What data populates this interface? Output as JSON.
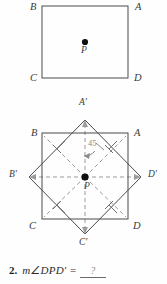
{
  "figure_top": {
    "name": "square-ABCD-with-center-point",
    "vertex_labels": [
      {
        "id": "B",
        "text": "B",
        "x": 30,
        "y": 3
      },
      {
        "id": "A",
        "text": "A",
        "x": 135,
        "y": 3
      },
      {
        "id": "C",
        "text": "C",
        "x": 30,
        "y": 75
      },
      {
        "id": "D",
        "text": "D",
        "x": 134,
        "y": 75
      }
    ],
    "center_point_label": {
      "text": "P",
      "x": 81,
      "y": 47
    },
    "square": {
      "x": 42,
      "y": 6,
      "width": 86,
      "height": 72
    },
    "center_dot": {
      "cx": 85,
      "cy": 42,
      "r": 3.1
    }
  },
  "figure_bottom": {
    "name": "square-ABCD-rotated-45-to-A'B'C'D'",
    "upright_square": {
      "x": 42,
      "y": 133,
      "width": 86,
      "height": 86
    },
    "rotated_square_vertices": [
      {
        "id": "A'",
        "x": 85,
        "y": 120
      },
      {
        "id": "D'",
        "x": 141,
        "y": 177
      },
      {
        "id": "C'",
        "x": 85,
        "y": 234
      },
      {
        "id": "B'",
        "x": 29,
        "y": 177
      }
    ],
    "center": {
      "cx": 85,
      "cy": 177,
      "r": 3.6
    },
    "vertex_labels": [
      {
        "id": "A-prime",
        "text": "A'",
        "x": 79,
        "y": 99
      },
      {
        "id": "B",
        "text": "B",
        "x": 31,
        "y": 129
      },
      {
        "id": "A",
        "text": "A",
        "x": 134,
        "y": 129
      },
      {
        "id": "B-prime",
        "text": "B'",
        "x": 9,
        "y": 171
      },
      {
        "id": "D-prime",
        "text": "D'",
        "x": 148,
        "y": 171
      },
      {
        "id": "C",
        "text": "C",
        "x": 29,
        "y": 222
      },
      {
        "id": "D",
        "text": "D",
        "x": 133,
        "y": 222
      },
      {
        "id": "C-prime",
        "text": "C'",
        "x": 79,
        "y": 239
      }
    ],
    "center_point_label": {
      "text": "P",
      "x": 84,
      "y": 183
    },
    "angle_annotation": {
      "value": "45",
      "x": 88,
      "y": 139
    }
  },
  "question": {
    "number": "2.",
    "expression": "m∠DPD′ =",
    "blank_value": "?"
  },
  "colors": {
    "solid_line": "#4a4a4a",
    "dashed_line": "#9b9b9b",
    "dot": "#111111",
    "annotation_gray": "#8a8a8a",
    "text": "#2b2b2b",
    "background": "#fefefe"
  }
}
